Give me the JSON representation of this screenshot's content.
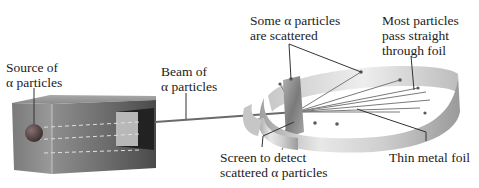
{
  "diagram": {
    "labels": {
      "source": {
        "line1": "Source of",
        "line2": "α particles"
      },
      "beam": {
        "line1": "Beam of",
        "line2": "α particles"
      },
      "scattered": {
        "line1": "Some α particles",
        "line2": "are scattered"
      },
      "most_pass": {
        "line1": "Most particles",
        "line2": "pass straight",
        "line3": "through foil"
      },
      "screen": {
        "line1": "Screen to detect",
        "line2": "scattered α particles"
      },
      "foil": {
        "line1": "Thin metal foil"
      }
    },
    "components": [
      "lead-box-source",
      "alpha-particle-source",
      "alpha-beam",
      "detector-screen-ring",
      "thin-metal-foil",
      "scatter-points"
    ],
    "colors": {
      "text": "#222222",
      "leader_line": "#333333",
      "box_dark": "#3a3a3a",
      "box_light": "#9a9a9a",
      "ring_light": "#e6e6e6",
      "ring_mid": "#b5b5b5",
      "beam": "#6a6a6a",
      "source_sphere": "#5a4a4a"
    }
  }
}
